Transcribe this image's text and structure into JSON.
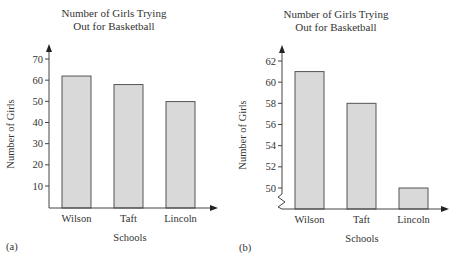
{
  "chart_data": [
    {
      "panel": "(a)",
      "type": "bar",
      "title": "Number of Girls Trying Out for Basketball",
      "title_lines": [
        "Number of Girls Trying",
        "Out for Basketball"
      ],
      "xlabel": "Schools",
      "ylabel": "Number of Girls",
      "categories": [
        "Wilson",
        "Taft",
        "Lincoln"
      ],
      "values": [
        62,
        58,
        50
      ],
      "yticks": [
        10,
        20,
        30,
        40,
        50,
        60,
        70
      ],
      "ylim": [
        0,
        75
      ],
      "axis_break": false,
      "grid": false,
      "bar_color": "#d9d9d9"
    },
    {
      "panel": "(b)",
      "type": "bar",
      "title": "Number of Girls Trying Out for Basketball",
      "title_lines": [
        "Number of Girls Trying",
        "Out for Basketball"
      ],
      "xlabel": "Schools",
      "ylabel": "Number of Girls",
      "categories": [
        "Wilson",
        "Taft",
        "Lincoln"
      ],
      "values": [
        61,
        58,
        50
      ],
      "yticks": [
        50,
        52,
        54,
        56,
        58,
        60,
        62
      ],
      "ylim": [
        48,
        63
      ],
      "axis_break": true,
      "grid": false,
      "bar_color": "#d9d9d9"
    }
  ],
  "labels": {
    "panel_a": "(a)",
    "panel_b": "(b)"
  }
}
